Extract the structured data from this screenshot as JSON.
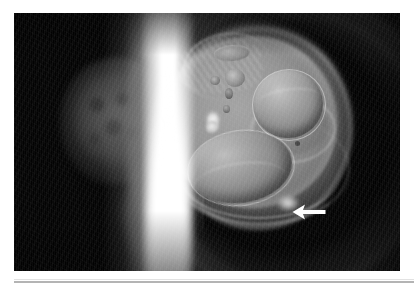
{
  "page": {
    "background_color": "#ffffff",
    "type": "medical-imaging-figure",
    "caption": ""
  },
  "figure": {
    "label": "",
    "frame_color": "#000000",
    "modality": "MRI",
    "view": "two-panel grayscale scan",
    "panels": [
      {
        "id": "left-panel",
        "name": "left-scan-panel",
        "description": "Dark grayscale field with a faint curved soft-tissue body-wall arc along the right margin and a mottled oval organ shadow.",
        "structures": [
          "body-wall-arc",
          "oval-organ-shadow",
          "mottled-texture"
        ]
      },
      {
        "id": "right-panel",
        "name": "right-scan-panel",
        "description": "Large round gestational-sac / abdominal mass with internal round and ovoid organ structures, encircled by concentric bright uterine-wall arcs.",
        "structures": [
          "concentric-outer-arcs",
          "round-sac-boundary",
          "upper-striated-band",
          "small-ovoid-upper",
          "nodule-cluster",
          "bright-echogenic-focus",
          "right-sphere",
          "secondary-ring",
          "lower-left-ovoid",
          "inner-lower-arc"
        ]
      }
    ],
    "separator": {
      "name": "bright-vertical-band",
      "description": "Bright white vertical band separating the two scan panels.",
      "color": "#ffffff"
    },
    "annotations": [
      {
        "type": "arrow",
        "name": "pointer-arrow",
        "direction": "left",
        "color": "#ffffff",
        "points_to": "focal bright lesion at the inferior-right margin of the sac"
      }
    ]
  },
  "rule": {
    "name": "bottom-divider",
    "color": "#b4b4b4"
  },
  "colors": {
    "background": "#ffffff",
    "panel": "#000000",
    "annotation": "#ffffff",
    "divider": "#b4b4b4",
    "tissue_mid": "#8b8b8b",
    "tissue_bright": "#f2f2f2"
  }
}
